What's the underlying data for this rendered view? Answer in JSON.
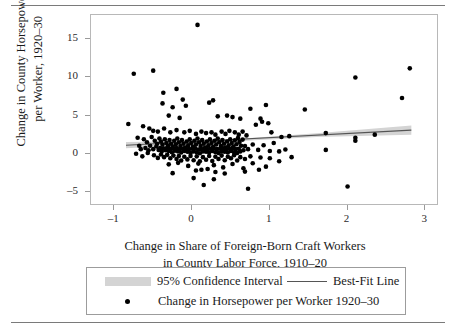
{
  "chart_data": {
    "type": "scatter",
    "title": "",
    "xlabel": "Change in Share of Foreign-Born Craft Workers in County Labor Force, 1910–20",
    "xlabel_line1": "Change in Share of Foreign-Born Craft Workers",
    "xlabel_line2": "in County Labor Force, 1910–20",
    "ylabel": "Change in County Horsepower per Worker, 1920–30",
    "ylabel_line1": "Change in County Horsepower",
    "ylabel_line2": "per Worker, 1920–30",
    "xlim": [
      -1.3,
      3.15
    ],
    "ylim": [
      -6.6,
      18.2
    ],
    "xticks": [
      -1,
      0,
      1,
      2,
      3
    ],
    "xtick_labels": [
      "–1",
      "0",
      "1",
      "2",
      "3"
    ],
    "yticks": [
      -5,
      0,
      5,
      10,
      15
    ],
    "ytick_labels": [
      "–5",
      "0",
      "5",
      "10",
      "15"
    ],
    "grid": false,
    "legend_position": "below-axes",
    "series": [
      {
        "name": "Change in Horsepower per Worker 1920–30",
        "type": "scatter",
        "marker": "filled-circle",
        "color": "#000000",
        "points": [
          [
            0.07,
            16.9
          ],
          [
            -0.75,
            10.5
          ],
          [
            -0.5,
            10.9
          ],
          [
            2.1,
            10.0
          ],
          [
            2.8,
            11.2
          ],
          [
            2.7,
            7.3
          ],
          [
            -0.37,
            8.0
          ],
          [
            -0.2,
            8.5
          ],
          [
            -0.12,
            7.1
          ],
          [
            0.22,
            6.7
          ],
          [
            0.27,
            7.0
          ],
          [
            -0.38,
            6.6
          ],
          [
            -0.25,
            6.1
          ],
          [
            -0.08,
            6.3
          ],
          [
            0.95,
            6.4
          ],
          [
            0.75,
            5.9
          ],
          [
            1.45,
            5.8
          ],
          [
            -0.3,
            5.0
          ],
          [
            -0.16,
            4.7
          ],
          [
            0.33,
            4.9
          ],
          [
            0.45,
            5.0
          ],
          [
            0.52,
            4.8
          ],
          [
            0.62,
            4.6
          ],
          [
            0.88,
            4.6
          ],
          [
            0.9,
            4.2
          ],
          [
            0.98,
            4.0
          ],
          [
            0.82,
            3.8
          ],
          [
            -0.82,
            3.9
          ],
          [
            -0.63,
            3.6
          ],
          [
            -0.55,
            3.3
          ],
          [
            -0.5,
            3.0
          ],
          [
            -0.44,
            2.9
          ],
          [
            -0.36,
            3.3
          ],
          [
            -0.28,
            2.8
          ],
          [
            -0.2,
            3.1
          ],
          [
            -0.1,
            2.8
          ],
          [
            -0.03,
            3.0
          ],
          [
            0.05,
            2.6
          ],
          [
            0.12,
            2.9
          ],
          [
            0.18,
            2.7
          ],
          [
            0.25,
            2.8
          ],
          [
            0.3,
            2.5
          ],
          [
            0.38,
            2.9
          ],
          [
            0.43,
            2.6
          ],
          [
            0.48,
            3.0
          ],
          [
            0.55,
            2.8
          ],
          [
            0.6,
            2.5
          ],
          [
            0.65,
            2.9
          ],
          [
            0.7,
            2.4
          ],
          [
            1.02,
            2.8
          ],
          [
            1.15,
            2.2
          ],
          [
            1.25,
            2.3
          ],
          [
            1.72,
            2.7
          ],
          [
            2.1,
            2.1
          ],
          [
            2.1,
            1.7
          ],
          [
            2.35,
            2.5
          ],
          [
            -0.7,
            2.1
          ],
          [
            -0.62,
            1.9
          ],
          [
            -0.58,
            1.5
          ],
          [
            -0.52,
            2.2
          ],
          [
            -0.48,
            1.7
          ],
          [
            -0.45,
            1.3
          ],
          [
            -0.42,
            2.0
          ],
          [
            -0.4,
            1.6
          ],
          [
            -0.38,
            1.2
          ],
          [
            -0.35,
            1.9
          ],
          [
            -0.33,
            1.4
          ],
          [
            -0.31,
            1.0
          ],
          [
            -0.29,
            1.8
          ],
          [
            -0.27,
            1.3
          ],
          [
            -0.25,
            0.9
          ],
          [
            -0.23,
            1.7
          ],
          [
            -0.21,
            1.2
          ],
          [
            -0.19,
            2.0
          ],
          [
            -0.17,
            1.5
          ],
          [
            -0.15,
            1.0
          ],
          [
            -0.13,
            1.8
          ],
          [
            -0.11,
            1.3
          ],
          [
            -0.09,
            0.8
          ],
          [
            -0.07,
            1.6
          ],
          [
            -0.05,
            1.1
          ],
          [
            -0.03,
            1.9
          ],
          [
            -0.01,
            1.4
          ],
          [
            0.01,
            0.9
          ],
          [
            0.03,
            1.7
          ],
          [
            0.05,
            1.2
          ],
          [
            0.07,
            2.0
          ],
          [
            0.09,
            1.5
          ],
          [
            0.11,
            1.0
          ],
          [
            0.13,
            1.8
          ],
          [
            0.15,
            1.3
          ],
          [
            0.17,
            0.8
          ],
          [
            0.19,
            1.6
          ],
          [
            0.21,
            1.1
          ],
          [
            0.23,
            1.9
          ],
          [
            0.25,
            1.4
          ],
          [
            0.27,
            0.9
          ],
          [
            0.29,
            1.7
          ],
          [
            0.31,
            1.2
          ],
          [
            0.33,
            2.0
          ],
          [
            0.35,
            1.5
          ],
          [
            0.37,
            1.0
          ],
          [
            0.39,
            1.8
          ],
          [
            0.41,
            1.3
          ],
          [
            0.43,
            0.8
          ],
          [
            0.45,
            1.6
          ],
          [
            0.47,
            1.1
          ],
          [
            0.49,
            1.9
          ],
          [
            0.51,
            1.4
          ],
          [
            0.53,
            0.95
          ],
          [
            0.55,
            1.75
          ],
          [
            0.57,
            1.25
          ],
          [
            0.59,
            2.05
          ],
          [
            0.61,
            1.55
          ],
          [
            0.63,
            1.05
          ],
          [
            0.65,
            1.85
          ],
          [
            -0.68,
            1.05
          ],
          [
            -0.66,
            0.6
          ],
          [
            -0.6,
            0.75
          ],
          [
            -0.56,
            0.45
          ],
          [
            -0.54,
            1.05
          ],
          [
            -0.5,
            0.6
          ],
          [
            -0.46,
            0.95
          ],
          [
            -0.43,
            0.5
          ],
          [
            -0.41,
            0.75
          ],
          [
            -0.39,
            0.3
          ],
          [
            -0.37,
            0.7
          ],
          [
            -0.34,
            0.45
          ],
          [
            -0.32,
            0.8
          ],
          [
            -0.3,
            0.35
          ],
          [
            -0.28,
            0.6
          ],
          [
            -0.26,
            0.2
          ],
          [
            -0.24,
            0.7
          ],
          [
            -0.22,
            0.4
          ],
          [
            -0.2,
            0.75
          ],
          [
            -0.18,
            0.3
          ],
          [
            -0.16,
            0.6
          ],
          [
            -0.14,
            0.15
          ],
          [
            -0.12,
            0.65
          ],
          [
            -0.1,
            0.35
          ],
          [
            -0.08,
            0.7
          ],
          [
            -0.06,
            0.25
          ],
          [
            -0.04,
            0.6
          ],
          [
            -0.02,
            0.1
          ],
          [
            0.0,
            0.65
          ],
          [
            0.02,
            0.3
          ],
          [
            0.04,
            0.7
          ],
          [
            0.06,
            0.2
          ],
          [
            0.08,
            0.55
          ],
          [
            0.1,
            0.05
          ],
          [
            0.12,
            0.6
          ],
          [
            0.14,
            0.3
          ],
          [
            0.16,
            0.7
          ],
          [
            0.18,
            0.25
          ],
          [
            0.2,
            0.6
          ],
          [
            0.22,
            0.15
          ],
          [
            0.24,
            0.65
          ],
          [
            0.26,
            0.35
          ],
          [
            0.28,
            0.7
          ],
          [
            0.3,
            0.2
          ],
          [
            0.32,
            0.6
          ],
          [
            0.34,
            0.1
          ],
          [
            0.36,
            0.65
          ],
          [
            0.38,
            0.3
          ],
          [
            0.4,
            0.7
          ],
          [
            0.42,
            0.25
          ],
          [
            0.44,
            0.6
          ],
          [
            0.46,
            0.15
          ],
          [
            0.48,
            0.65
          ],
          [
            0.5,
            0.35
          ],
          [
            0.52,
            0.7
          ],
          [
            0.54,
            0.2
          ],
          [
            0.56,
            0.6
          ],
          [
            0.58,
            0.1
          ],
          [
            0.6,
            0.65
          ],
          [
            0.62,
            0.3
          ],
          [
            0.66,
            0.45
          ],
          [
            0.68,
            1.0
          ],
          [
            0.72,
            0.6
          ],
          [
            0.78,
            1.2
          ],
          [
            0.85,
            0.5
          ],
          [
            0.92,
            1.1
          ],
          [
            1.0,
            0.35
          ],
          [
            1.05,
            1.4
          ],
          [
            1.12,
            0.3
          ],
          [
            1.2,
            0.55
          ],
          [
            -0.72,
            0.0
          ],
          [
            -0.64,
            -0.35
          ],
          [
            -0.57,
            0.1
          ],
          [
            -0.49,
            -0.2
          ],
          [
            -0.44,
            -0.55
          ],
          [
            -0.4,
            -0.1
          ],
          [
            -0.36,
            -0.45
          ],
          [
            -0.32,
            -0.15
          ],
          [
            -0.28,
            -0.6
          ],
          [
            -0.24,
            -0.25
          ],
          [
            -0.2,
            -0.7
          ],
          [
            -0.17,
            -0.3
          ],
          [
            -0.14,
            -0.9
          ],
          [
            -0.1,
            -0.4
          ],
          [
            -0.06,
            -0.75
          ],
          [
            -0.02,
            -0.3
          ],
          [
            0.02,
            -0.85
          ],
          [
            0.06,
            -0.35
          ],
          [
            0.1,
            -1.0
          ],
          [
            0.14,
            -0.45
          ],
          [
            0.18,
            -0.8
          ],
          [
            0.22,
            -0.3
          ],
          [
            0.26,
            -0.95
          ],
          [
            0.3,
            -0.4
          ],
          [
            0.34,
            -0.7
          ],
          [
            0.38,
            -0.25
          ],
          [
            0.42,
            -0.85
          ],
          [
            0.46,
            -0.4
          ],
          [
            0.5,
            -0.6
          ],
          [
            0.54,
            -0.2
          ],
          [
            0.58,
            -0.9
          ],
          [
            0.62,
            -0.45
          ],
          [
            0.68,
            -0.7
          ],
          [
            0.75,
            -0.35
          ],
          [
            0.88,
            -0.5
          ],
          [
            1.0,
            -0.6
          ],
          [
            1.12,
            -1.0
          ],
          [
            1.28,
            -0.45
          ],
          [
            -0.3,
            -1.4
          ],
          [
            -0.18,
            -1.2
          ],
          [
            -0.05,
            -1.6
          ],
          [
            0.08,
            -1.3
          ],
          [
            0.2,
            -2.0
          ],
          [
            0.28,
            -1.5
          ],
          [
            0.4,
            -1.8
          ],
          [
            0.52,
            -1.35
          ],
          [
            0.66,
            -1.9
          ],
          [
            0.78,
            -1.25
          ],
          [
            0.95,
            -1.7
          ],
          [
            -0.25,
            -2.55
          ],
          [
            0.05,
            -2.2
          ],
          [
            0.12,
            -2.1
          ],
          [
            0.3,
            -2.4
          ],
          [
            0.42,
            -2.6
          ],
          [
            0.68,
            -2.35
          ],
          [
            0.86,
            -2.1
          ],
          [
            0.02,
            -3.2
          ],
          [
            0.28,
            -3.35
          ],
          [
            0.15,
            -4.1
          ],
          [
            0.72,
            -4.6
          ],
          [
            2.0,
            -4.3
          ],
          [
            1.72,
            0.5
          ]
        ]
      }
    ],
    "fit_line": {
      "name": "Best-Fit Line",
      "color": "#555555",
      "x_start": -0.85,
      "y_start": 1.1,
      "x_end": 2.82,
      "y_end": 3.1
    },
    "confidence_band": {
      "name": "95% Confidence Interval",
      "level": "95%",
      "color": "#d4d4d4",
      "upper": [
        [
          -0.85,
          1.55
        ],
        [
          0.0,
          1.65
        ],
        [
          0.8,
          2.1
        ],
        [
          1.6,
          2.7
        ],
        [
          2.82,
          3.7
        ]
      ],
      "lower": [
        [
          -0.85,
          0.7
        ],
        [
          0.0,
          1.15
        ],
        [
          0.8,
          1.75
        ],
        [
          1.6,
          2.2
        ],
        [
          2.82,
          2.5
        ]
      ]
    }
  },
  "legend": {
    "band_label": "95% Confidence Interval",
    "line_label": "Best-Fit Line",
    "points_label": "Change in Horsepower per Worker 1920–30"
  }
}
